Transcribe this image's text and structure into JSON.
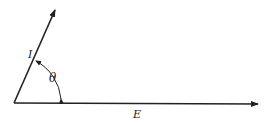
{
  "diagram": {
    "type": "phasor",
    "colors": {
      "stroke": "#222222",
      "background": "#ffffff"
    },
    "vectors": [
      {
        "name": "current",
        "label": "I",
        "from": [
          14,
          103
        ],
        "to": [
          55,
          10
        ]
      },
      {
        "name": "voltage",
        "label": "E",
        "from": [
          14,
          103
        ],
        "to": [
          258,
          104
        ]
      }
    ],
    "angle": {
      "label": "θ",
      "between": [
        "I",
        "E"
      ]
    }
  }
}
